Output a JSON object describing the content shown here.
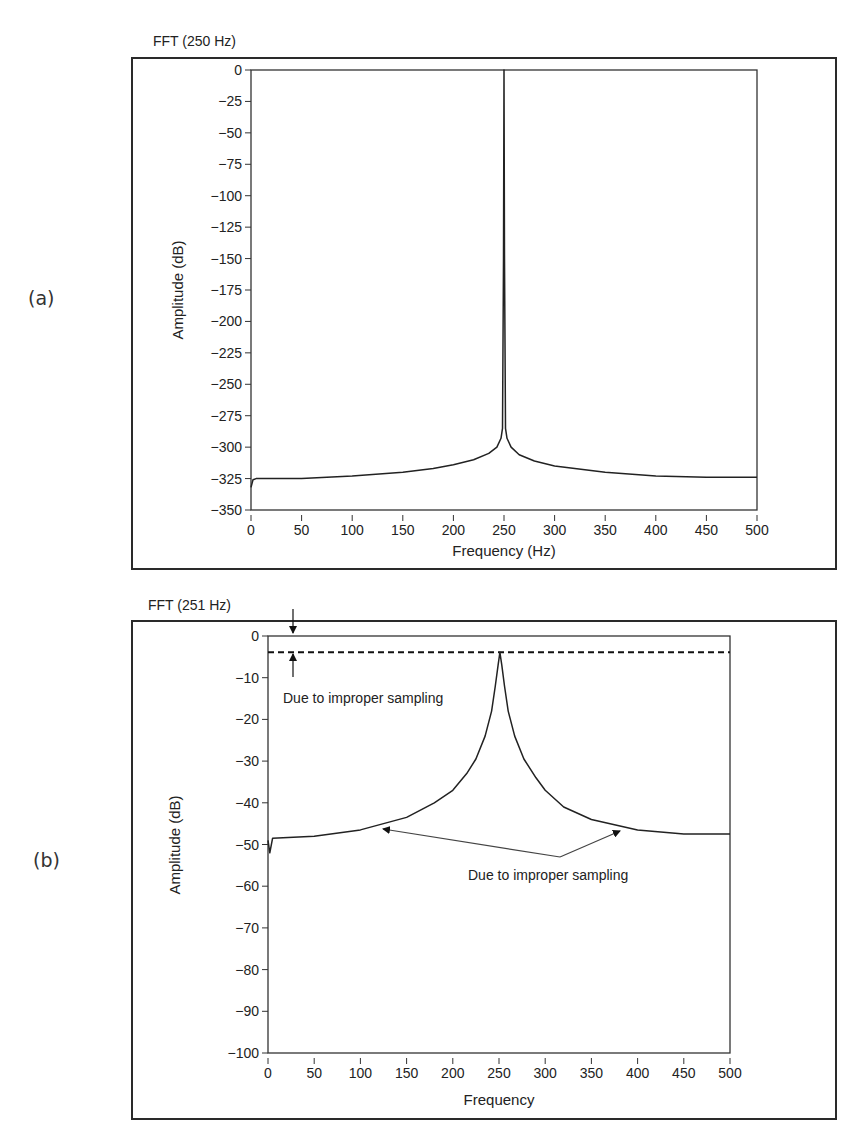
{
  "panels": [
    {
      "id": "a",
      "label": "(a)"
    },
    {
      "id": "b",
      "label": "(b)"
    }
  ],
  "chart_data": [
    {
      "type": "line",
      "title": "FFT (250 Hz)",
      "xlabel": "Frequency (Hz)",
      "ylabel": "Amplitude (dB)",
      "xlim": [
        0,
        500
      ],
      "ylim": [
        -350,
        0
      ],
      "xticks": [
        0,
        50,
        100,
        150,
        200,
        250,
        300,
        350,
        400,
        450,
        500
      ],
      "yticks": [
        0,
        -25,
        -50,
        -75,
        -100,
        -125,
        -150,
        -175,
        -200,
        -225,
        -250,
        -275,
        -300,
        -325,
        -350
      ],
      "grid": false,
      "series": [
        {
          "name": "FFT 250 Hz",
          "x": [
            0,
            2,
            5,
            50,
            100,
            150,
            180,
            200,
            220,
            235,
            243,
            247,
            248.5,
            249.5,
            250,
            250.5,
            251.5,
            253,
            257,
            265,
            280,
            300,
            350,
            400,
            450,
            500
          ],
          "y": [
            -332,
            -326,
            -325,
            -325,
            -323,
            -320,
            -317,
            -314,
            -310,
            -305,
            -300,
            -293,
            -285,
            -150,
            0,
            -150,
            -285,
            -293,
            -300,
            -306,
            -311,
            -315,
            -320,
            -323,
            -324,
            -324
          ]
        }
      ],
      "annotations": []
    },
    {
      "type": "line",
      "title": "FFT (251 Hz)",
      "xlabel": "Frequency",
      "ylabel": "Amplitude (dB)",
      "xlim": [
        0,
        500
      ],
      "ylim": [
        -100,
        0
      ],
      "xticks": [
        0,
        50,
        100,
        150,
        200,
        250,
        300,
        350,
        400,
        450,
        500
      ],
      "yticks": [
        0,
        -10,
        -20,
        -30,
        -40,
        -50,
        -60,
        -70,
        -80,
        -90,
        -100
      ],
      "grid": false,
      "reference_line": {
        "y": -3.9,
        "style": "dashed"
      },
      "series": [
        {
          "name": "FFT 251 Hz",
          "x": [
            0,
            2,
            5,
            50,
            100,
            150,
            180,
            200,
            215,
            225,
            235,
            242,
            246,
            249,
            251,
            253,
            256,
            260,
            267,
            277,
            290,
            300,
            320,
            350,
            400,
            450,
            500
          ],
          "y": [
            -49,
            -52,
            -48.5,
            -48,
            -46.5,
            -43.5,
            -40,
            -37,
            -33,
            -29.5,
            -24,
            -18,
            -12,
            -7,
            -3.9,
            -7,
            -12,
            -18,
            -24,
            -29.5,
            -34,
            -37,
            -41,
            -44,
            -46.5,
            -47.5,
            -47.5
          ]
        }
      ],
      "annotations": [
        {
          "text": "Due to improper sampling",
          "target": "gap between 0 dB and dashed peak line"
        },
        {
          "text": "Due to improper sampling",
          "target": "spectral leakage skirts at ~120 Hz and ~385 Hz"
        }
      ]
    }
  ]
}
